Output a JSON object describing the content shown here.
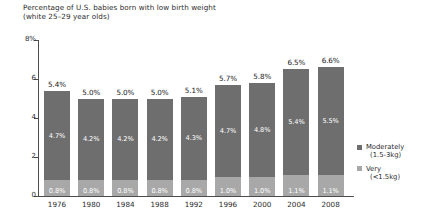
{
  "chart_data": {
    "type": "bar",
    "subtype": "stacked-bar",
    "title": "Percentage of U.S. babies born with low birth weight\n(white 25–29 year olds)",
    "title_line1": "Percentage of U.S. babies born with low birth weight",
    "title_line2": "(white 25–29 year olds)",
    "xlabel": "",
    "ylabel": "",
    "ylim": [
      0,
      8
    ],
    "yticks": [
      0,
      2,
      4,
      6,
      8
    ],
    "ytick_labels": [
      "0",
      "2",
      "4",
      "6",
      "8%"
    ],
    "grid": false,
    "legend_position": "right",
    "categories": [
      "1976",
      "1980",
      "1984",
      "1988",
      "1992",
      "1996",
      "2000",
      "2004",
      "2008"
    ],
    "series": [
      {
        "name": "Moderately (1.5-3kg)",
        "color": "#6e6e6e",
        "values": [
          4.7,
          4.2,
          4.2,
          4.2,
          4.3,
          4.7,
          4.8,
          5.4,
          5.5
        ],
        "value_labels": [
          "4.7%",
          "4.2%",
          "4.2%",
          "4.2%",
          "4.3%",
          "4.7%",
          "4.8%",
          "5.4%",
          "5.5%"
        ]
      },
      {
        "name": "Very (<1.5kg)",
        "color": "#a8a8a8",
        "values": [
          0.8,
          0.8,
          0.8,
          0.8,
          0.8,
          1.0,
          1.0,
          1.1,
          1.1
        ],
        "value_labels": [
          "0.8%",
          "0.8%",
          "0.8%",
          "0.8%",
          "0.8%",
          "1.0%",
          "1.0%",
          "1.1%",
          "1.1%"
        ]
      }
    ],
    "totals": [
      5.4,
      5.0,
      5.0,
      5.0,
      5.1,
      5.7,
      5.8,
      6.5,
      6.6
    ],
    "total_labels": [
      "5.4%",
      "5.0%",
      "5.0%",
      "5.0%",
      "5.1%",
      "5.7%",
      "5.8%",
      "6.5%",
      "6.6%"
    ]
  },
  "legend": {
    "items": [
      {
        "label": "Moderately",
        "sub": "(1.5-3kg)",
        "color": "#6e6e6e"
      },
      {
        "label": "Very",
        "sub": "(<1.5kg)",
        "color": "#a8a8a8"
      }
    ]
  }
}
